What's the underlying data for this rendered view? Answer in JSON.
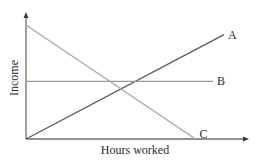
{
  "chart_data": {
    "type": "line",
    "title": "",
    "xlabel": "Hours worked",
    "ylabel": "Income",
    "xlim": [
      0,
      10
    ],
    "ylim": [
      0,
      10
    ],
    "grid": false,
    "ticks": false,
    "legend": "inline labels at line ends",
    "series": [
      {
        "name": "A",
        "points": [
          [
            0,
            0
          ],
          [
            9.0,
            8.7
          ]
        ],
        "color": "#5a5a5a",
        "label_pos": "end"
      },
      {
        "name": "B",
        "points": [
          [
            0,
            4.8
          ],
          [
            8.5,
            4.8
          ]
        ],
        "color": "#9a9a9a",
        "label_pos": "end"
      },
      {
        "name": "C",
        "points": [
          [
            0,
            9.5
          ],
          [
            7.7,
            0
          ]
        ],
        "color": "#a8a8a8",
        "label_pos": "end"
      }
    ],
    "axis_color": "#6e6e6e"
  }
}
